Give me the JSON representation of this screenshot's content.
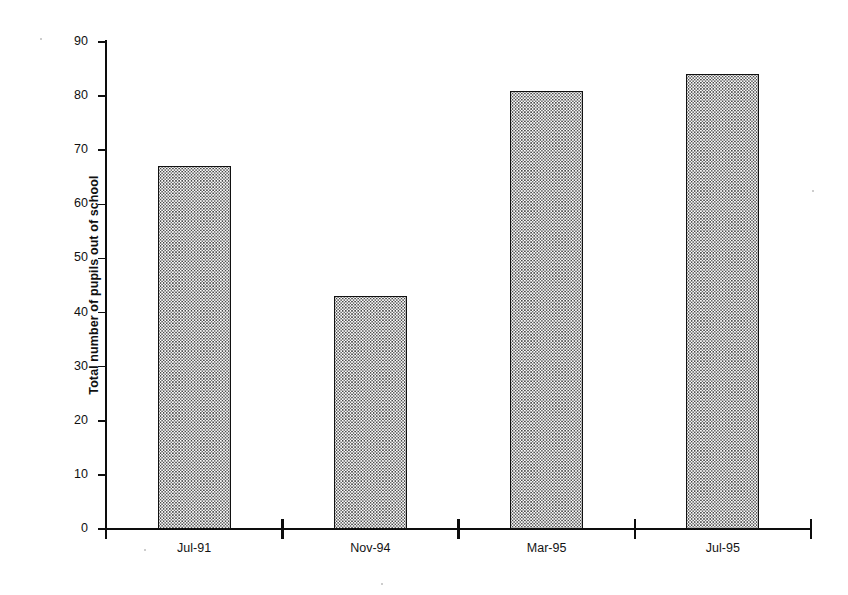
{
  "chart_data": {
    "type": "bar",
    "title": "",
    "subtitle": "",
    "xlabel": "",
    "ylabel": "Total number of pupils out of school",
    "categories": [
      "Jul-91",
      "Nov-94",
      "Mar-95",
      "Jul-95"
    ],
    "values": [
      67,
      43,
      81,
      84
    ],
    "ylim": [
      0,
      90
    ],
    "ytick_values": [
      0,
      10,
      20,
      30,
      40,
      50,
      60,
      70,
      80,
      90
    ],
    "ytick_labels": [
      "0",
      "10",
      "20",
      "30",
      "40",
      "50",
      "60",
      "70",
      "80",
      "90"
    ],
    "grid": false,
    "legend": null,
    "legend_position": "none",
    "series": [
      {
        "name": "Total number of pupils out of school",
        "values": [
          67,
          43,
          81,
          84
        ]
      }
    ],
    "annotations": [],
    "style": {
      "bar_fill": "#ffffff",
      "bar_pattern": "fine-dotted-stipple",
      "bar_pattern_color": "#5a5a5a",
      "bar_outline": "#111111",
      "axis_color": "#0d0d0d",
      "text_color": "#141414",
      "background": "#ffffff"
    }
  },
  "axes": {
    "y_title": "Total number of pupils out of school",
    "y_ticks": [
      {
        "label": "90",
        "value": 90
      },
      {
        "label": "80",
        "value": 80
      },
      {
        "label": "70",
        "value": 70
      },
      {
        "label": "60",
        "value": 60
      },
      {
        "label": "50",
        "value": 50
      },
      {
        "label": "40",
        "value": 40
      },
      {
        "label": "30",
        "value": 30
      },
      {
        "label": "20",
        "value": 20
      },
      {
        "label": "10",
        "value": 10
      },
      {
        "label": "0",
        "value": 0
      }
    ],
    "x_ticks": [
      {
        "label": "Jul-91"
      },
      {
        "label": "Nov-94"
      },
      {
        "label": "Mar-95"
      },
      {
        "label": "Jul-95"
      }
    ]
  }
}
